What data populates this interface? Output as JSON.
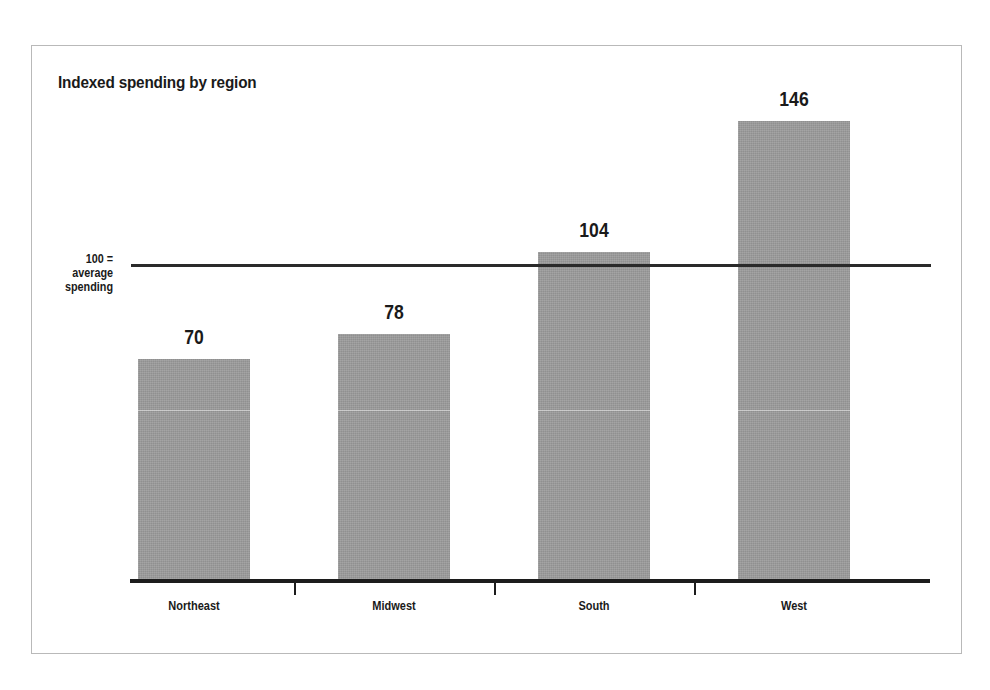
{
  "chart_data": {
    "type": "bar",
    "title": "Indexed spending by region",
    "categories": [
      "Northeast",
      "Midwest",
      "South",
      "West"
    ],
    "values": [
      70,
      78,
      104,
      146
    ],
    "value_labels": [
      "70",
      "78",
      "104",
      "146"
    ],
    "xlabel": "",
    "ylabel": "",
    "ylim": [
      0,
      160
    ],
    "grid": false,
    "legend": null,
    "reference_line": {
      "value": 100,
      "label_lines": [
        "100 =",
        "average",
        "spending"
      ]
    },
    "series": [
      {
        "name": "Indexed spending",
        "values": [
          70,
          78,
          104,
          146
        ]
      }
    ],
    "colors": {
      "bar_fill": "#9a9a9a",
      "axis": "#1c1c1c",
      "reference_line": "#2a2a2a",
      "text": "#1a1a1a",
      "frame_border": "#b9b9b9",
      "background": "#ffffff"
    }
  }
}
